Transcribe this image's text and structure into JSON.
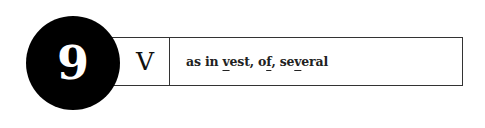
{
  "entry": {
    "number": "9",
    "letter": "V",
    "example": {
      "prefix": "as in ",
      "word1_pre": "",
      "word1_ul": "v",
      "word1_post": "est",
      "sep1": ", ",
      "word2_pre": "o",
      "word2_ul": "f",
      "word2_post": "",
      "sep2": ", ",
      "word3_pre": "se",
      "word3_ul": "v",
      "word3_post": "eral"
    }
  },
  "colors": {
    "badge_bg": "#000000",
    "badge_text": "#ffffff",
    "border": "#333333"
  }
}
